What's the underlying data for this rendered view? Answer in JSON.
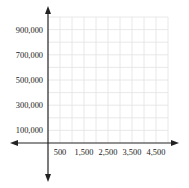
{
  "chart_data": {
    "type": "scatter",
    "title": "",
    "xlabel": "",
    "ylabel": "",
    "x_ticks": [
      "500",
      "1,500",
      "2,500",
      "3,500",
      "4,500"
    ],
    "y_ticks": [
      "900,000",
      "700,000",
      "500,000",
      "300,000",
      "100,000"
    ],
    "x_tick_values": [
      500,
      1500,
      2500,
      3500,
      4500
    ],
    "y_tick_values": [
      900000,
      700000,
      500000,
      300000,
      100000
    ],
    "xlim": [
      0,
      5000
    ],
    "ylim": [
      0,
      1000000
    ],
    "grid": true,
    "grid_step_x": 500,
    "grid_step_y": 100000,
    "series": [],
    "axes_with_arrows": true
  },
  "colors": {
    "axis": "#222222",
    "grid": "#e2e2e2",
    "text": "#222222"
  }
}
